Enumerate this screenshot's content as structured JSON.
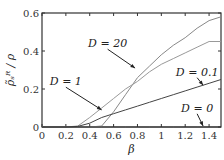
{
  "chart_data": {
    "type": "line",
    "title": "",
    "xlabel": "β",
    "ylabel": "ρ_R^s / ρ",
    "xlim": [
      0,
      1.5
    ],
    "ylim": [
      0,
      0.6
    ],
    "xticks": [
      0,
      0.2,
      0.4,
      0.6,
      0.8,
      1,
      1.2,
      1.4
    ],
    "xtick_labels": [
      "0",
      "0.2",
      "0.4",
      "0.6",
      "0.8",
      "1",
      "1.2",
      "1.4"
    ],
    "yticks": [
      0,
      0.2,
      0.4,
      0.6
    ],
    "ytick_labels": [
      "0",
      "0.2",
      "0.4",
      "0.6"
    ],
    "grid": false,
    "legend": "none (inline annotations with arrows)",
    "x": [
      0,
      0.1,
      0.2,
      0.3,
      0.4,
      0.5,
      0.6,
      0.7,
      0.8,
      0.9,
      1.0,
      1.1,
      1.2,
      1.3,
      1.4,
      1.5
    ],
    "series": [
      {
        "name": "D=20",
        "color": "#888888",
        "values": [
          0,
          0,
          0,
          0,
          0,
          0.005,
          0.08,
          0.17,
          0.26,
          0.32,
          0.38,
          0.43,
          0.47,
          0.52,
          0.56,
          0.58
        ]
      },
      {
        "name": "D=1",
        "color": "#999999",
        "values": [
          0,
          0,
          0,
          0.005,
          0.05,
          0.1,
          0.15,
          0.2,
          0.24,
          0.29,
          0.33,
          0.36,
          0.39,
          0.42,
          0.45,
          0.45
        ]
      },
      {
        "name": "D=0.1",
        "color": "#444444",
        "values": [
          0,
          0,
          0,
          0.003,
          0.02,
          0.05,
          0.07,
          0.09,
          0.11,
          0.13,
          0.15,
          0.17,
          0.19,
          0.21,
          0.23,
          0.25
        ]
      },
      {
        "name": "D=0",
        "color": "#333333",
        "values": [
          0,
          0,
          0,
          0,
          0,
          0,
          0,
          0,
          0,
          0,
          0,
          0,
          0,
          0,
          0,
          0
        ]
      }
    ],
    "annotations": [
      {
        "text": "D = 20",
        "x": 0.55,
        "y": 0.42,
        "arrow_to": [
          0.78,
          0.31
        ]
      },
      {
        "text": "D = 1",
        "x": 0.2,
        "y": 0.22,
        "arrow_to": [
          0.5,
          0.09
        ]
      },
      {
        "text": "D = 0.1",
        "x": 1.3,
        "y": 0.27,
        "arrow_to": [
          1.35,
          0.22
        ]
      },
      {
        "text": "D = 0",
        "x": 1.3,
        "y": 0.08,
        "arrow_to": [
          1.35,
          0.005
        ]
      }
    ]
  },
  "labels": {
    "xlabel": "β",
    "ylabel": "ρ̃ₛᴿ / ρ",
    "ann_d20": "D = 20",
    "ann_d1": "D = 1",
    "ann_d01": "D = 0.1",
    "ann_d0": "D = 0"
  }
}
